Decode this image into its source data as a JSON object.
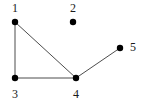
{
  "figure": {
    "name": "undirected-graph-diagram",
    "background_color": "#ffffff",
    "width": 146,
    "height": 103
  },
  "chart_data": {
    "type": "diagram",
    "subtype": "node-link-graph",
    "title": "",
    "xlabel": "",
    "ylabel": "",
    "directed": false,
    "grid": false,
    "legend": null,
    "node_color": "#000000",
    "edge_color": "#4d4d4d",
    "node_radius": 3.2,
    "edge_width": 1,
    "nodes": [
      {
        "id": "1",
        "label": "1",
        "x": 15,
        "y": 22,
        "label_x": 15,
        "label_y": 8,
        "label_position": "above"
      },
      {
        "id": "2",
        "label": "2",
        "x": 73,
        "y": 22,
        "label_x": 73,
        "label_y": 8,
        "label_position": "above"
      },
      {
        "id": "3",
        "label": "3",
        "x": 15,
        "y": 78,
        "label_x": 15,
        "label_y": 94,
        "label_position": "below"
      },
      {
        "id": "4",
        "label": "4",
        "x": 76,
        "y": 78,
        "label_x": 76,
        "label_y": 94,
        "label_position": "below"
      },
      {
        "id": "5",
        "label": "5",
        "x": 120,
        "y": 48,
        "label_x": 133,
        "label_y": 47,
        "label_position": "right"
      }
    ],
    "edges": [
      {
        "source": "1",
        "target": "3"
      },
      {
        "source": "1",
        "target": "4"
      },
      {
        "source": "3",
        "target": "4"
      },
      {
        "source": "4",
        "target": "5"
      }
    ],
    "isolated_nodes": [
      "2"
    ],
    "node_count": 5,
    "edge_count": 4
  }
}
